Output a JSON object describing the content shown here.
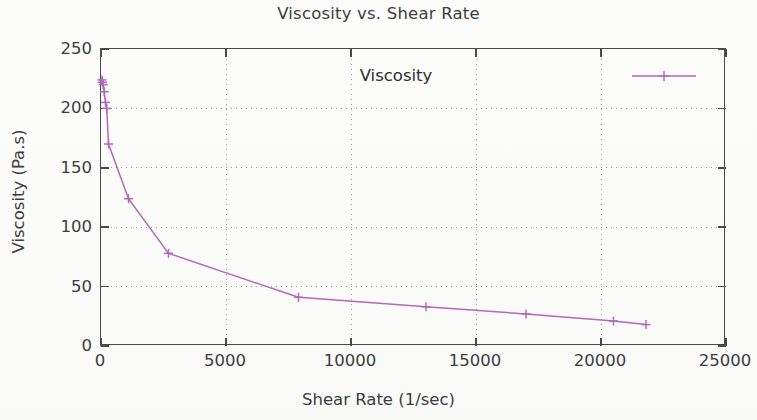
{
  "chart_data": {
    "type": "line",
    "title": "Viscosity vs. Shear Rate",
    "xlabel": "Shear Rate (1/sec)",
    "ylabel": "Viscosity (Pa.s)",
    "xlim": [
      0,
      25000
    ],
    "ylim": [
      0,
      250
    ],
    "xticks": [
      0,
      5000,
      10000,
      15000,
      20000,
      25000
    ],
    "yticks": [
      0,
      50,
      100,
      150,
      200,
      250
    ],
    "xtick_labels": [
      "0",
      "5000",
      "10000",
      "15000",
      "20000",
      "25000"
    ],
    "ytick_labels": [
      "0",
      "50",
      "100",
      "150",
      "200",
      "250"
    ],
    "grid": true,
    "grid_style": "dotted",
    "legend": [
      "Viscosity"
    ],
    "legend_position": "top-right-inside",
    "marker": "plus",
    "line_color": "#b06ab8",
    "series": [
      {
        "name": "Viscosity",
        "x": [
          40,
          60,
          90,
          130,
          180,
          230,
          300,
          1100,
          2700,
          7900,
          13000,
          17000,
          20500,
          21800
        ],
        "y": [
          224,
          222,
          220,
          214,
          205,
          200,
          170,
          124,
          78,
          41,
          33,
          27,
          21,
          18
        ]
      }
    ]
  },
  "chart": {
    "title": "Viscosity vs. Shear Rate",
    "xaxis_title": "Shear Rate (1/sec)",
    "yaxis_title": "Viscosity (Pa.s)",
    "legend_label": "Viscosity"
  }
}
